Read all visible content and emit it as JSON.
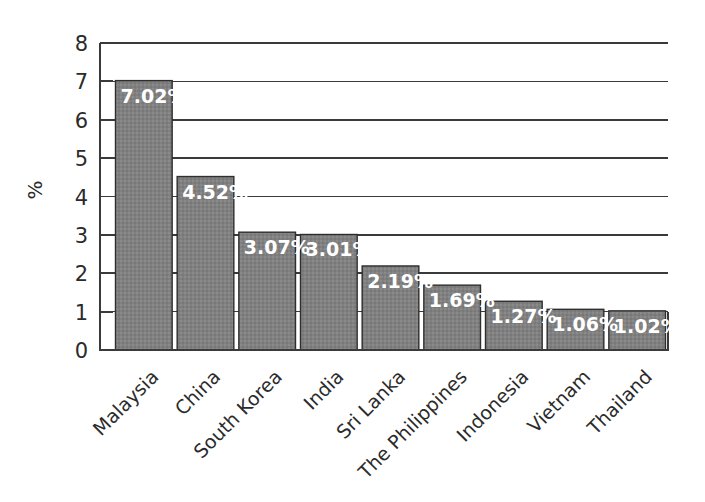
{
  "chart_data": {
    "type": "bar",
    "title": "",
    "subtitle": "",
    "xlabel": "",
    "ylabel": "%",
    "ylim": [
      0,
      8
    ],
    "ytick_labels": [
      "0",
      "1",
      "2",
      "3",
      "4",
      "5",
      "6",
      "7",
      "8"
    ],
    "grid": true,
    "grid_axis": "y",
    "legend": false,
    "legend_position": "none",
    "orientation": "vertical",
    "categories": [
      "Malaysia",
      "China",
      "South Korea",
      "India",
      "Sri Lanka",
      "The Philippines",
      "Indonesia",
      "Vietnam",
      "Thailand"
    ],
    "values": [
      7.02,
      4.52,
      3.07,
      3.01,
      2.19,
      1.69,
      1.27,
      1.06,
      1.02
    ],
    "data_labels": [
      "7.02%",
      "4.52%",
      "3.07%",
      "3.01%",
      "2.19%",
      "1.69%",
      "1.27%",
      "1.06%",
      "1.02%"
    ],
    "series": [
      {
        "name": "",
        "values": [
          7.02,
          4.52,
          3.07,
          3.01,
          2.19,
          1.69,
          1.27,
          1.06,
          1.02
        ]
      }
    ]
  },
  "style": {
    "bar_fill": "#808080",
    "bar_stroke": "#2e2e2e",
    "grid_color": "#3a3a3a",
    "axis_color": "#3a3a3a",
    "label_color": "#2b2b2b",
    "data_label_color": "#ffffff",
    "background": "#ffffff",
    "category_label_rotation": "-45"
  }
}
